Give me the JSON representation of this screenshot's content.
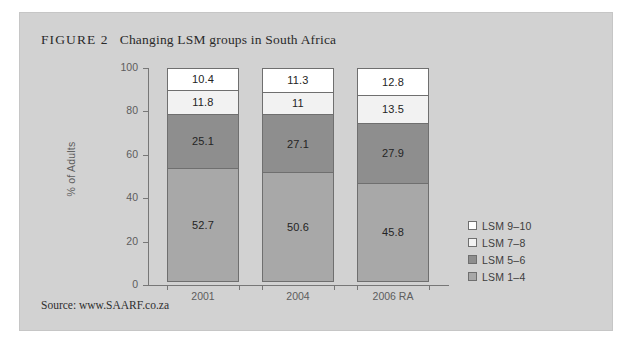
{
  "figure": {
    "label": "FIGURE 2",
    "caption": "Changing LSM groups in South Africa",
    "source": "Source: www.SAARF.co.za"
  },
  "colors": {
    "panel_background": "#d2d2d2",
    "page_background": "#ffffff",
    "axis": "#777777",
    "segment_border": "#6f6f6f",
    "lsm_9_10": "#ffffff",
    "lsm_7_8": "#f2f2f2",
    "lsm_5_6": "#8e8e8e",
    "lsm_1_4": "#a8a8a8"
  },
  "chart_data": {
    "type": "bar",
    "stacked": true,
    "title": "Changing LSM groups in South Africa",
    "xlabel": "",
    "ylabel": "% of Adults",
    "ylim": [
      0,
      100
    ],
    "yticks": [
      0,
      20,
      40,
      60,
      80,
      100
    ],
    "grid": false,
    "legend_position": "right",
    "categories": [
      "2001",
      "2004",
      "2006 RA"
    ],
    "series": [
      {
        "name": "LSM 1–4",
        "color": "#a8a8a8",
        "values": [
          52.7,
          50.6,
          45.8
        ]
      },
      {
        "name": "LSM 5–6",
        "color": "#8e8e8e",
        "values": [
          25.1,
          27.1,
          27.9
        ]
      },
      {
        "name": "LSM 7–8",
        "color": "#f2f2f2",
        "values": [
          11.8,
          11.0,
          13.5
        ]
      },
      {
        "name": "LSM 9–10",
        "color": "#ffffff",
        "values": [
          10.4,
          11.3,
          12.8
        ]
      }
    ],
    "bars": [
      {
        "category": "2001",
        "segments": [
          {
            "name": "LSM 9–10",
            "value": 10.4,
            "label": "10.4",
            "color": "#ffffff"
          },
          {
            "name": "LSM 7–8",
            "value": 11.8,
            "label": "11.8",
            "color": "#f2f2f2"
          },
          {
            "name": "LSM 5–6",
            "value": 25.1,
            "label": "25.1",
            "color": "#8e8e8e"
          },
          {
            "name": "LSM 1–4",
            "value": 52.7,
            "label": "52.7",
            "color": "#a8a8a8"
          }
        ]
      },
      {
        "category": "2004",
        "segments": [
          {
            "name": "LSM 9–10",
            "value": 11.3,
            "label": "11.3",
            "color": "#ffffff"
          },
          {
            "name": "LSM 7–8",
            "value": 11.0,
            "label": "11",
            "color": "#f2f2f2"
          },
          {
            "name": "LSM 5–6",
            "value": 27.1,
            "label": "27.1",
            "color": "#8e8e8e"
          },
          {
            "name": "LSM 1–4",
            "value": 50.6,
            "label": "50.6",
            "color": "#a8a8a8"
          }
        ]
      },
      {
        "category": "2006 RA",
        "segments": [
          {
            "name": "LSM 9–10",
            "value": 12.8,
            "label": "12.8",
            "color": "#ffffff"
          },
          {
            "name": "LSM 7–8",
            "value": 13.5,
            "label": "13.5",
            "color": "#f2f2f2"
          },
          {
            "name": "LSM 5–6",
            "value": 27.9,
            "label": "27.9",
            "color": "#8e8e8e"
          },
          {
            "name": "LSM 1–4",
            "value": 45.8,
            "label": "45.8",
            "color": "#a8a8a8"
          }
        ]
      }
    ],
    "legend": [
      {
        "label": "LSM 9–10",
        "color": "#ffffff"
      },
      {
        "label": "LSM 7–8",
        "color": "#f2f2f2"
      },
      {
        "label": "LSM 5–6",
        "color": "#8e8e8e"
      },
      {
        "label": "LSM 1–4",
        "color": "#a8a8a8"
      }
    ]
  }
}
